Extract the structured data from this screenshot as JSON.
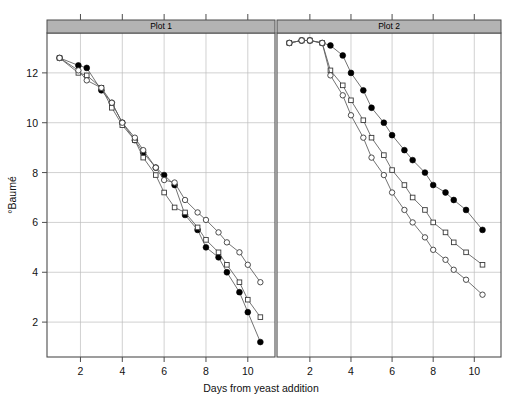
{
  "figure": {
    "title": "",
    "xlabel": "Days from yeast addition",
    "ylabel": "°Baumé",
    "panels": [
      {
        "strip_label": "Plot 1"
      },
      {
        "strip_label": "Plot 2"
      }
    ]
  },
  "chart_data": {
    "type": "line",
    "title": "",
    "xlabel": "Days from yeast addition",
    "ylabel": "°Baumé",
    "xlim": [
      0.4,
      11.3
    ],
    "ylim": [
      0.6,
      13.6
    ],
    "xticks": [
      2,
      4,
      6,
      8,
      10
    ],
    "yticks": [
      2,
      4,
      6,
      8,
      10,
      12
    ],
    "grid": true,
    "legend": "none",
    "panel_layout": "1x2 lattice",
    "panels": [
      {
        "name": "Plot 1",
        "strip_label": "Plot 1",
        "series": [
          {
            "name": "Ferment A (filled circle)",
            "marker": "filled-circle",
            "x": [
              1.0,
              1.9,
              2.3,
              3.0,
              3.5,
              4.0,
              4.6,
              5.0,
              5.6,
              6.0,
              6.5,
              7.0,
              7.6,
              8.0,
              8.6,
              9.0,
              9.6,
              10.0,
              10.6
            ],
            "y": [
              12.6,
              12.3,
              12.2,
              11.3,
              10.8,
              10.0,
              9.3,
              8.8,
              8.2,
              7.9,
              7.5,
              6.3,
              5.7,
              5.0,
              4.6,
              4.0,
              3.2,
              2.4,
              1.2
            ]
          },
          {
            "name": "Ferment B (open square)",
            "marker": "open-square",
            "x": [
              1.0,
              1.9,
              2.3,
              3.0,
              3.5,
              4.0,
              4.6,
              5.0,
              5.6,
              6.0,
              6.5,
              7.0,
              7.6,
              8.0,
              8.6,
              9.0,
              9.6,
              10.0,
              10.6
            ],
            "y": [
              12.6,
              12.0,
              11.9,
              11.4,
              10.6,
              9.9,
              9.3,
              8.6,
              7.9,
              7.2,
              6.6,
              6.4,
              5.8,
              5.3,
              4.8,
              4.3,
              3.6,
              2.9,
              2.2
            ]
          },
          {
            "name": "Ferment C (open circle)",
            "marker": "open-circle",
            "x": [
              1.0,
              1.9,
              2.3,
              3.0,
              3.5,
              4.0,
              4.6,
              5.0,
              5.6,
              6.0,
              6.5,
              7.0,
              7.6,
              8.0,
              8.6,
              9.0,
              9.6,
              10.0,
              10.6
            ],
            "y": [
              12.6,
              12.1,
              11.7,
              11.4,
              10.8,
              10.0,
              9.4,
              8.9,
              8.2,
              7.7,
              7.6,
              6.9,
              6.4,
              6.1,
              5.6,
              5.2,
              4.8,
              4.3,
              3.6
            ]
          }
        ]
      },
      {
        "name": "Plot 2",
        "strip_label": "Plot 2",
        "series": [
          {
            "name": "Ferment A (filled circle)",
            "marker": "filled-circle",
            "x": [
              1.0,
              1.6,
              2.0,
              2.6,
              3.0,
              3.6,
              4.0,
              4.6,
              5.0,
              5.6,
              6.0,
              6.6,
              7.0,
              7.6,
              8.0,
              8.6,
              9.0,
              9.6,
              10.4
            ],
            "y": [
              13.2,
              13.3,
              13.3,
              13.2,
              13.1,
              12.7,
              12.0,
              11.3,
              10.6,
              10.0,
              9.5,
              8.9,
              8.5,
              8.0,
              7.5,
              7.2,
              6.9,
              6.5,
              5.7
            ]
          },
          {
            "name": "Ferment B (open square)",
            "marker": "open-square",
            "x": [
              1.0,
              1.6,
              2.0,
              2.6,
              3.0,
              3.6,
              4.0,
              4.6,
              5.0,
              5.6,
              6.0,
              6.6,
              7.0,
              7.6,
              8.0,
              8.6,
              9.0,
              9.6,
              10.4
            ],
            "y": [
              13.2,
              13.3,
              13.3,
              13.2,
              12.1,
              11.5,
              10.9,
              10.1,
              9.4,
              8.7,
              8.1,
              7.5,
              7.0,
              6.5,
              6.0,
              5.6,
              5.2,
              4.8,
              4.3
            ]
          },
          {
            "name": "Ferment C (open circle)",
            "marker": "open-circle",
            "x": [
              1.0,
              1.6,
              2.0,
              2.6,
              3.0,
              3.6,
              4.0,
              4.6,
              5.0,
              5.6,
              6.0,
              6.6,
              7.0,
              7.6,
              8.0,
              8.6,
              9.0,
              9.6,
              10.4
            ],
            "y": [
              13.2,
              13.3,
              13.3,
              13.2,
              11.9,
              11.1,
              10.3,
              9.4,
              8.6,
              7.9,
              7.2,
              6.5,
              6.0,
              5.4,
              4.9,
              4.5,
              4.1,
              3.7,
              3.1
            ]
          }
        ]
      }
    ]
  },
  "colors": {
    "strip_fill": "#b3b3b3",
    "grid": "#bdbdbd",
    "border": "#4d4d4d",
    "line": "#5a5a5a",
    "marker_fill": "#000000",
    "marker_open": "#ffffff",
    "text": "#111111",
    "background": "#ffffff"
  },
  "geometry": {
    "panel1": {
      "x0": 47,
      "x1": 275,
      "y0": 33,
      "y1": 357
    },
    "panel2": {
      "x0": 277,
      "x1": 501,
      "y0": 33,
      "y1": 357
    },
    "strip_top": 20,
    "strip_bottom": 33,
    "xtick_values": [
      2,
      4,
      6,
      8,
      10
    ],
    "ytick_values": [
      2,
      4,
      6,
      8,
      10,
      12
    ],
    "xmin": 0.4,
    "xmax": 11.3,
    "ymin": 0.6,
    "ymax": 13.6
  }
}
